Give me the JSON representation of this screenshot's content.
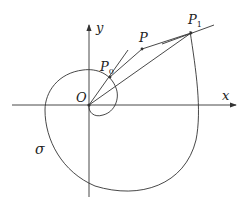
{
  "diagram": {
    "labels": {
      "x_axis": "x",
      "y_axis": "y",
      "origin": "O",
      "point_p0": "P",
      "point_p0_sub": "0",
      "point_p": "P",
      "point_p1": "P",
      "point_p1_sub": "1",
      "curve": "σ"
    },
    "colors": {
      "stroke": "#333333",
      "background": "#ffffff"
    }
  }
}
